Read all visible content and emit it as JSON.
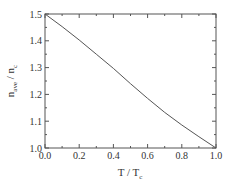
{
  "chart_data": {
    "type": "line",
    "title": "",
    "xlabel": "T / T_c",
    "ylabel": "n_ave / n_c",
    "xlabel_parts": {
      "main": "T / T",
      "sub": "c"
    },
    "ylabel_parts": {
      "main1": "n",
      "sub1": "ave",
      "mid": " / n",
      "sub2": "c"
    },
    "xlim": [
      0.0,
      1.0
    ],
    "ylim": [
      1.0,
      1.5
    ],
    "x_ticks": [
      "0.0",
      "0.2",
      "0.4",
      "0.6",
      "0.8",
      "1.0"
    ],
    "y_ticks": [
      "1.0",
      "1.1",
      "1.2",
      "1.3",
      "1.4",
      "1.5"
    ],
    "grid": false,
    "legend": null,
    "series": [
      {
        "name": "n_ave / n_c",
        "x": [
          0.0,
          0.1,
          0.2,
          0.3,
          0.4,
          0.5,
          0.6,
          0.7,
          0.8,
          0.9,
          1.0
        ],
        "y": [
          1.5,
          1.453,
          1.403,
          1.35,
          1.297,
          1.24,
          1.185,
          1.133,
          1.086,
          1.042,
          1.0
        ]
      }
    ],
    "colors": {
      "line": "#555555",
      "axes": "#555555"
    }
  }
}
